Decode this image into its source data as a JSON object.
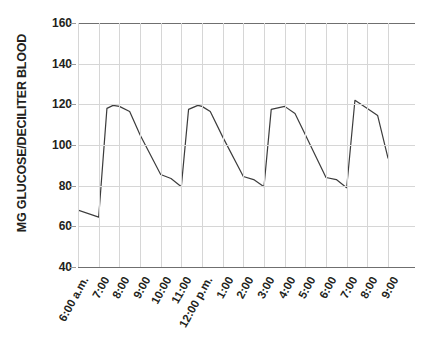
{
  "chart_data": {
    "type": "line",
    "title": "",
    "xlabel": "",
    "ylabel": "MG GLUCOSE/DECILITER BLOOD",
    "ylim": [
      40,
      160
    ],
    "yticks": [
      40,
      60,
      80,
      100,
      120,
      140,
      160
    ],
    "ytick_labels": [
      "40",
      "60",
      "80",
      "100",
      "120",
      "140",
      "160"
    ],
    "grid": true,
    "legend": "none",
    "categories": [
      "6:00 a.m.",
      "7:00",
      "8:00",
      "9:00",
      "10:00",
      "11:00",
      "12:00 p.m.",
      "1:00",
      "2:00",
      "3:00",
      "4:00",
      "5:00",
      "6:00",
      "7:00",
      "8:00",
      "9:00"
    ],
    "series": [
      {
        "name": "Blood glucose",
        "color": "#3c3c3c",
        "points": [
          {
            "x": 6.0,
            "label": "6:00 a.m.",
            "y": 68
          },
          {
            "x": 7.0,
            "label": "7:00",
            "y": 64.5
          },
          {
            "x": 7.4,
            "label": "",
            "y": 118
          },
          {
            "x": 7.7,
            "label": "",
            "y": 119.5
          },
          {
            "x": 8.0,
            "label": "8:00",
            "y": 119
          },
          {
            "x": 8.5,
            "label": "",
            "y": 116.5
          },
          {
            "x": 9.0,
            "label": "9:00",
            "y": 105
          },
          {
            "x": 10.0,
            "label": "10:00",
            "y": 85.5
          },
          {
            "x": 10.5,
            "label": "",
            "y": 83.5
          },
          {
            "x": 11.0,
            "label": "11:00",
            "y": 79.5
          },
          {
            "x": 11.35,
            "label": "",
            "y": 117.5
          },
          {
            "x": 11.8,
            "label": "",
            "y": 119.5
          },
          {
            "x": 12.0,
            "label": "12:00 p.m.",
            "y": 119
          },
          {
            "x": 12.4,
            "label": "",
            "y": 116.5
          },
          {
            "x": 13.0,
            "label": "1:00",
            "y": 104
          },
          {
            "x": 14.0,
            "label": "2:00",
            "y": 84.5
          },
          {
            "x": 14.5,
            "label": "",
            "y": 83
          },
          {
            "x": 15.0,
            "label": "3:00",
            "y": 79.5
          },
          {
            "x": 15.35,
            "label": "",
            "y": 117.5
          },
          {
            "x": 16.0,
            "label": "4:00",
            "y": 119
          },
          {
            "x": 16.5,
            "label": "",
            "y": 115.5
          },
          {
            "x": 17.0,
            "label": "5:00",
            "y": 105
          },
          {
            "x": 18.0,
            "label": "6:00",
            "y": 84
          },
          {
            "x": 18.5,
            "label": "",
            "y": 83
          },
          {
            "x": 19.0,
            "label": "7:00",
            "y": 79
          },
          {
            "x": 19.4,
            "label": "",
            "y": 122
          },
          {
            "x": 20.0,
            "label": "8:00",
            "y": 118
          },
          {
            "x": 20.5,
            "label": "",
            "y": 114.5
          },
          {
            "x": 21.0,
            "label": "9:00",
            "y": 93.5
          }
        ]
      }
    ]
  },
  "axis": {
    "y_title": "MG GLUCOSE/DECILITER BLOOD",
    "y_labels": [
      "160",
      "140",
      "120",
      "100",
      "80",
      "60",
      "40"
    ],
    "x_labels": [
      "6:00 a.m.",
      "7:00",
      "8:00",
      "9:00",
      "10:00",
      "11:00",
      "12:00 p.m.",
      "1:00",
      "2:00",
      "3:00",
      "4:00",
      "5:00",
      "6:00",
      "7:00",
      "8:00",
      "9:00"
    ]
  },
  "colors": {
    "line": "#3c3c3c",
    "grid": "#d6d6d6",
    "axis_bold": "#6f6f6f",
    "text": "#231f20",
    "background": "#ffffff"
  }
}
